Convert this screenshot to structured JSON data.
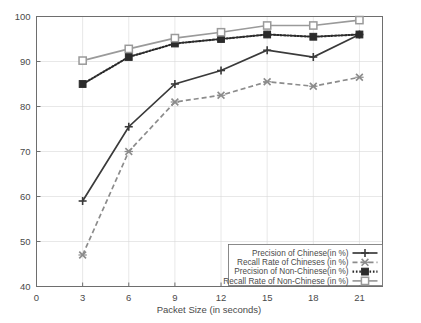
{
  "chart_data": {
    "type": "line",
    "title": "",
    "xlabel": "Packet Size (in seconds)",
    "ylabel": "",
    "x": [
      3,
      6,
      9,
      12,
      15,
      18,
      21
    ],
    "xticks": [
      0,
      3,
      6,
      9,
      12,
      15,
      18,
      21
    ],
    "yticks": [
      40,
      50,
      60,
      70,
      80,
      90,
      100
    ],
    "xlim": [
      0,
      22.5
    ],
    "ylim": [
      40,
      100
    ],
    "grid": true,
    "legend_position": "lower right",
    "series": [
      {
        "name": "Precision of Chinese(in %)",
        "values": [
          59,
          75.5,
          85,
          88,
          92.5,
          91,
          96
        ],
        "color": "#3a3a3a",
        "marker": "plus",
        "linestyle": "solid"
      },
      {
        "name": "Recall Rate of Chineses (in %)",
        "values": [
          47,
          70,
          81,
          82.5,
          85.5,
          84.5,
          86.5
        ],
        "color": "#8c8c8c",
        "marker": "cross",
        "linestyle": "dashed"
      },
      {
        "name": "Precision of Non-Chinese(in %)",
        "values": [
          85,
          91,
          94,
          95,
          96,
          95.5,
          96
        ],
        "color": "#2b2b2b",
        "marker": "filled-square",
        "linestyle": "dotted"
      },
      {
        "name": "Recall Rate of Non-Chinese (in %)",
        "values": [
          90.2,
          92.8,
          95.2,
          96.5,
          98,
          98,
          99.2
        ],
        "color": "#9a9a9a",
        "marker": "open-square",
        "linestyle": "solid"
      }
    ]
  },
  "axis": {
    "x_tick_labels": [
      "0",
      "3",
      "6",
      "9",
      "12",
      "15",
      "18",
      "21"
    ],
    "y_tick_labels": [
      "40",
      "50",
      "60",
      "70",
      "80",
      "90",
      "100"
    ],
    "x_title": "Packet Size (in seconds)"
  },
  "legend": {
    "entries": [
      {
        "label": "Precision of Chinese(in %)"
      },
      {
        "label": "Recall Rate of Chineses (in %)"
      },
      {
        "label": "Precision of Non-Chinese(in %)"
      },
      {
        "label": "Recall Rate of Non-Chinese (in %)"
      }
    ]
  }
}
